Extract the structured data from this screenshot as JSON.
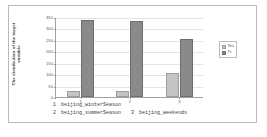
{
  "chart_data": {
    "type": "bar",
    "title": "",
    "xlabel": "",
    "ylabel": "The distribution of the target variable",
    "categories": [
      "1",
      "2",
      "3"
    ],
    "series": [
      {
        "name": "Tes",
        "values": [
          25,
          25,
          105
        ],
        "color": "#c4c4c4"
      },
      {
        "name": "Tr",
        "values": [
          335,
          332,
          255
        ],
        "color": "#8a8a8a"
      }
    ],
    "yticks": [
      0,
      50,
      100,
      150,
      200,
      250,
      300,
      350
    ],
    "ylim": [
      0,
      350
    ],
    "grid": true,
    "legend_position": "right"
  },
  "legend": {
    "entries": [
      {
        "label": "Tes",
        "swatch": "test"
      },
      {
        "label": "Tr",
        "swatch": "train"
      }
    ]
  },
  "caption": {
    "lines": [
      {
        "num": "1",
        "text": "beijing_winterSeason",
        "num2": "",
        "text2": ""
      },
      {
        "num": "2",
        "text": "beijing_summerSeason",
        "num2": "3",
        "text2": "beijing_weekends"
      }
    ]
  }
}
